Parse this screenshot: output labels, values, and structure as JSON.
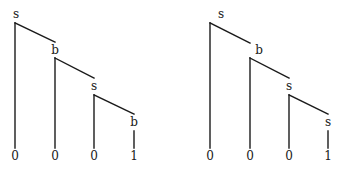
{
  "trees": [
    {
      "id": "left",
      "nodes": [
        {
          "label": "s",
          "x": 15,
          "lx": 16,
          "ly": 15,
          "drop_top": 23
        },
        {
          "label": "b",
          "x": 55,
          "lx": 55,
          "ly": 51,
          "drop_top": 58
        },
        {
          "label": "s",
          "x": 94,
          "lx": 94,
          "ly": 87,
          "drop_top": 95
        },
        {
          "label": "b",
          "x": 134,
          "lx": 134,
          "ly": 123,
          "drop_top": 131
        }
      ],
      "leaves": [
        "0",
        "0",
        "0",
        "1"
      ]
    },
    {
      "id": "right",
      "nodes": [
        {
          "label": "s",
          "x": 210,
          "lx": 221,
          "ly": 15,
          "drop_top": 23
        },
        {
          "label": "b",
          "x": 250,
          "lx": 259,
          "ly": 51,
          "drop_top": 58
        },
        {
          "label": "s",
          "x": 289,
          "lx": 289,
          "ly": 87,
          "drop_top": 95
        },
        {
          "label": "s",
          "x": 328,
          "lx": 328,
          "ly": 123,
          "drop_top": 131
        }
      ],
      "leaves": [
        "0",
        "0",
        "0",
        "1"
      ]
    }
  ]
}
